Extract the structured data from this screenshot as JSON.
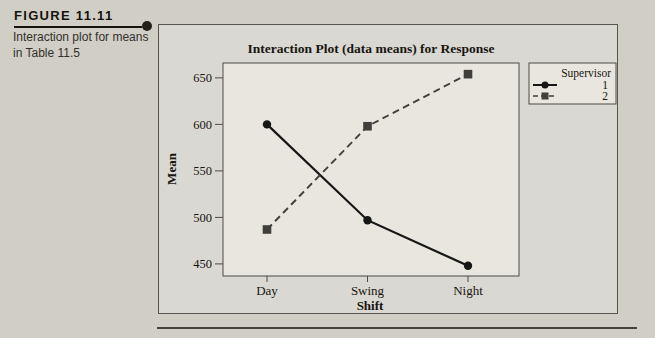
{
  "caption": {
    "heading": "FIGURE 11.11",
    "line1": "Interaction plot for means",
    "line2": "in Table 11.5"
  },
  "chart_data": {
    "type": "line",
    "title": "Interaction Plot (data means) for Response",
    "xlabel": "Shift",
    "ylabel": "Mean",
    "categories": [
      "Day",
      "Swing",
      "Night"
    ],
    "yticks": [
      450,
      500,
      550,
      600,
      650
    ],
    "ylim": [
      437,
      666
    ],
    "grid": false,
    "legend": {
      "title": "Supervisor",
      "position": "top-right"
    },
    "series": [
      {
        "name": "1",
        "marker": "circle",
        "line_style": "solid",
        "color": "#161616",
        "values": [
          600,
          497,
          448
        ]
      },
      {
        "name": "2",
        "marker": "square",
        "line_style": "dashed",
        "color": "#403f3c",
        "values": [
          487,
          598,
          654
        ]
      }
    ]
  },
  "colors": {
    "page_bg": "#d1cec5",
    "figure_bg": "#dad8d2",
    "plot_bg": "#e8e6df",
    "frame_stroke": "#4c4a45",
    "ink": "#17160f"
  }
}
